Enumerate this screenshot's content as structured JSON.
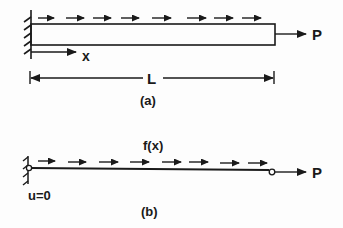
{
  "figure_a": {
    "caption": "(a)",
    "axis_label": "x",
    "length_label": "L",
    "force_label": "P",
    "distributed_load_arrows": 8
  },
  "figure_b": {
    "caption": "(b)",
    "load_label": "f(x)",
    "boundary_label": "u=0",
    "force_label": "P",
    "distributed_load_arrows": 8
  },
  "colors": {
    "ink": "#1a1a1a",
    "background": "#fdfdfd"
  }
}
